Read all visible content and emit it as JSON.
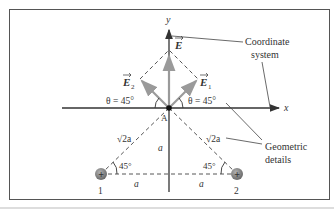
{
  "diagram": {
    "axes": {
      "x_label": "x",
      "y_label": "y",
      "origin_label": "A"
    },
    "vectors": {
      "E": "E",
      "E1": "E",
      "E1_sub": "1",
      "E2": "E",
      "E2_sub": "2"
    },
    "angles": {
      "theta_left": "θ = 45°",
      "theta_right": "θ = 45°",
      "bottom_left": "45°",
      "bottom_right": "45°"
    },
    "distances": {
      "hyp_left": "√2a",
      "hyp_right": "√2a",
      "vertical": "a",
      "base_left": "a",
      "base_right": "a"
    },
    "charges": [
      {
        "label": "1",
        "sign": "+"
      },
      {
        "label": "2",
        "sign": "+"
      }
    ],
    "callouts": {
      "coordinate_line1": "Coordinate",
      "coordinate_line2": "system",
      "geometric_line1": "Geometric",
      "geometric_line2": "details"
    },
    "colors": {
      "axis": "#333333",
      "vector_gray": "#a0a0a0",
      "charge_fill": "#8a8a8a",
      "frame": "#555555"
    }
  }
}
